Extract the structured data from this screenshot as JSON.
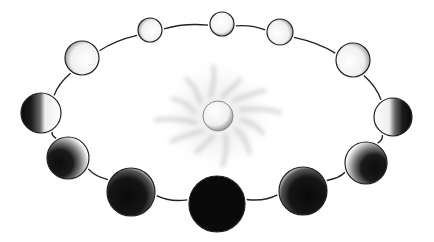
{
  "diagram": {
    "type": "moon-phases-orbit",
    "center_body": {
      "name": "sun",
      "x": 218,
      "y": 116,
      "r": 15
    },
    "orbit": {
      "cx": 217,
      "cy": 117,
      "rx": 190,
      "ry": 92
    },
    "colors": {
      "line": "#222222",
      "dark": "#0a0a0a",
      "light": "#ffffff",
      "glow": "#cfcfcf"
    },
    "moons": [
      {
        "phase": "full",
        "x": 222,
        "y": 24,
        "r": 12,
        "lit": "full"
      },
      {
        "phase": "waning-gibbous",
        "x": 280,
        "y": 32,
        "r": 13,
        "lit": "gibbous-left"
      },
      {
        "phase": "waning-gibbous",
        "x": 353,
        "y": 60,
        "r": 17,
        "lit": "gibbous-left"
      },
      {
        "phase": "last-quarter",
        "x": 393,
        "y": 117,
        "r": 19,
        "lit": "half-left"
      },
      {
        "phase": "waning-crescent",
        "x": 366,
        "y": 163,
        "r": 21,
        "lit": "crescent-left"
      },
      {
        "phase": "waning-crescent",
        "x": 303,
        "y": 191,
        "r": 24,
        "lit": "thin-left"
      },
      {
        "phase": "new",
        "x": 217,
        "y": 204,
        "r": 28,
        "lit": "none"
      },
      {
        "phase": "waxing-crescent",
        "x": 131,
        "y": 192,
        "r": 24,
        "lit": "thin-right"
      },
      {
        "phase": "waxing-crescent",
        "x": 68,
        "y": 158,
        "r": 21,
        "lit": "crescent-right"
      },
      {
        "phase": "first-quarter",
        "x": 41,
        "y": 113,
        "r": 20,
        "lit": "half-right"
      },
      {
        "phase": "waxing-gibbous",
        "x": 82,
        "y": 58,
        "r": 17,
        "lit": "gibbous-right"
      },
      {
        "phase": "waxing-gibbous",
        "x": 150,
        "y": 30,
        "r": 12,
        "lit": "gibbous-right"
      }
    ]
  }
}
